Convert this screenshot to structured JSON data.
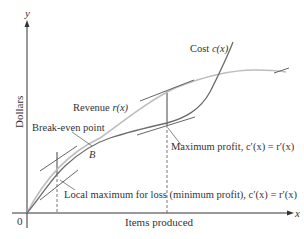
{
  "diagram": {
    "title": "",
    "axes": {
      "y_var": "y",
      "x_var": "x",
      "y_label": "Dollars",
      "x_label": "Items produced",
      "origin_label": "0"
    },
    "curves": {
      "cost": {
        "label_prefix": "Cost ",
        "label_func": "c(x)",
        "color": "#6b6b6b"
      },
      "revenue": {
        "label_prefix": "Revenue ",
        "label_func": "r(x)",
        "color": "#bdbdbd"
      }
    },
    "annotations": {
      "break_even": "Break-even point",
      "break_even_point": "B",
      "max_profit": "Maximum profit, c′(x) = r′(x)",
      "local_max_loss": "Local maximum for loss (minimum profit), c′(x) = r′(x)"
    },
    "colors": {
      "axis": "#333333",
      "cost_curve": "#6b6b6b",
      "revenue_curve": "#bdbdbd",
      "tangent": "#555555",
      "text": "#333333"
    }
  }
}
